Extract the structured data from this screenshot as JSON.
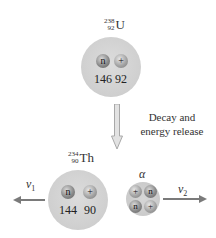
{
  "diagram": {
    "parent": {
      "symbol": "U",
      "mass_number": "238",
      "atomic_number": "92",
      "neutron_label": "n",
      "proton_label": "+",
      "neutron_count": "146",
      "proton_count": "92"
    },
    "process": {
      "caption_line1": "Decay and",
      "caption_line2": "energy release"
    },
    "daughter": {
      "symbol": "Th",
      "mass_number": "234",
      "atomic_number": "90",
      "neutron_label": "n",
      "proton_label": "+",
      "neutron_count": "144",
      "proton_count": "90",
      "velocity_symbol": "v",
      "velocity_sub": "1"
    },
    "alpha": {
      "label": "α",
      "particles": [
        "+",
        "n",
        "n",
        "+"
      ],
      "velocity_symbol": "v",
      "velocity_sub": "2"
    },
    "colors": {
      "nucleus_fill": "#d4d4d4",
      "neutron_fill": "#7c7c7c",
      "proton_fill": "#a0a0a0",
      "arrow": "#7a7a7a",
      "down_arrow_fill": "#e0e0e0",
      "down_arrow_stroke": "#a8a8a8"
    }
  }
}
